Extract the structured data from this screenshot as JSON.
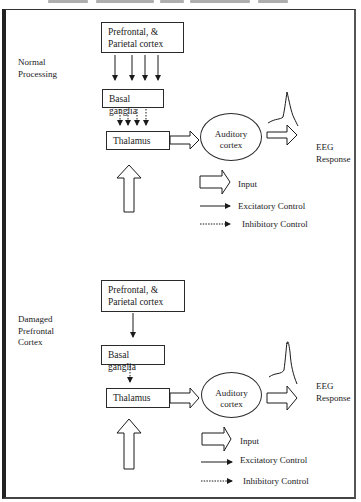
{
  "figure": {
    "panels": [
      {
        "id": "normal",
        "title": "Normal Processing",
        "title_lines": [
          "Normal",
          "Processing"
        ],
        "nodes": {
          "prefrontal": {
            "line1": "Prefrontal, &",
            "line2": "Parietal cortex"
          },
          "basal_ganglia": "Basal ganglia",
          "thalamus": "Thalamus",
          "auditory": {
            "line1": "Auditory",
            "line2": "cortex"
          },
          "eeg": {
            "line1": "EEG",
            "line2": "Response"
          }
        },
        "connections": {
          "prefrontal_to_basal": {
            "type": "excitatory",
            "count": 4
          },
          "basal_to_thalamus": {
            "type": "inhibitory",
            "count": 4
          },
          "thalamus_to_auditory": {
            "type": "input"
          },
          "auditory_to_eeg": {
            "type": "input"
          },
          "external_to_thalamus": {
            "type": "input"
          }
        },
        "eeg_waveform": "small peak",
        "legend": {
          "input": "Input",
          "excitatory": "Excitatory Control",
          "inhibitory": "Inhibitory Control"
        }
      },
      {
        "id": "damaged",
        "title": "Damaged Prefrontal Cortex",
        "title_lines": [
          "Damaged",
          "Prefrontal",
          "Cortex"
        ],
        "nodes": {
          "prefrontal": {
            "line1": "Prefrontal, &",
            "line2": "Parietal cortex"
          },
          "basal_ganglia": "Basal ganglia",
          "thalamus": "Thalamus",
          "auditory": {
            "line1": "Auditory",
            "line2": "cortex"
          },
          "eeg": {
            "line1": "EEG",
            "line2": "Response"
          }
        },
        "connections": {
          "prefrontal_to_basal": {
            "type": "excitatory",
            "count": 1
          },
          "basal_to_thalamus": {
            "type": "inhibitory",
            "count": 1
          },
          "thalamus_to_auditory": {
            "type": "input"
          },
          "auditory_to_eeg": {
            "type": "input"
          },
          "external_to_thalamus": {
            "type": "input"
          }
        },
        "eeg_waveform": "large peak",
        "legend": {
          "input": "Input",
          "excitatory": "Excitatory Control",
          "inhibitory": "Inhibitory Control"
        }
      }
    ],
    "colors": {
      "stroke": "#1a1a1a",
      "frame": "#333333",
      "background": "#ffffff"
    }
  }
}
